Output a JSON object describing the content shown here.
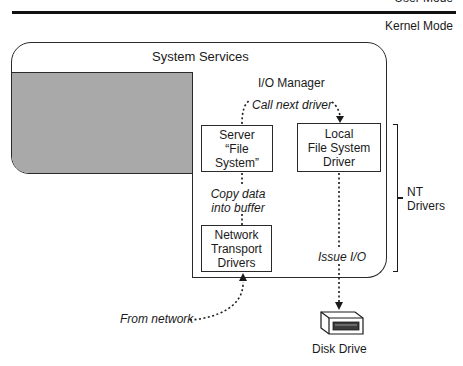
{
  "modes": {
    "user_mode": "User Mode",
    "kernel_mode": "Kernel Mode"
  },
  "system_services": {
    "label": "System Services"
  },
  "io_manager": {
    "label": "I/O Manager"
  },
  "boxes": {
    "server_fs": {
      "line1": "Server",
      "line2": "“File System”"
    },
    "local_fs": {
      "line1": "Local",
      "line2": "File System",
      "line3": "Driver"
    },
    "network_transport": {
      "line1": "Network",
      "line2": "Transport",
      "line3": "Drivers"
    }
  },
  "annotations": {
    "call_next_driver": "Call next driver",
    "copy_data_line1": "Copy data",
    "copy_data_line2": "into buffer",
    "issue_io": "Issue I/O",
    "from_network": "From network"
  },
  "bracket": {
    "line1": "NT",
    "line2": "Drivers"
  },
  "disk": {
    "label": "Disk Drive"
  },
  "colors": {
    "shaded_region": "#a9a9a9",
    "line": "#1a1a1a"
  }
}
